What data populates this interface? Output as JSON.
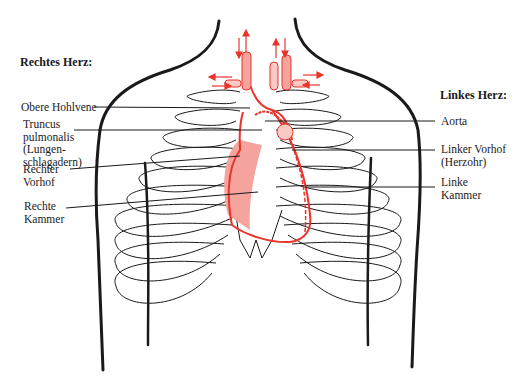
{
  "diagram": {
    "title_right_heart": "Rechtes Herz:",
    "title_left_heart": "Linkes Herz:",
    "colors": {
      "ink": "#1a1a1a",
      "heart_red": "#e8342c",
      "heart_fill": "#f4a49c",
      "background": "#ffffff"
    },
    "labels_right": [
      {
        "id": "obere-hohlvene",
        "lines": [
          "Obere Hohlvene"
        ]
      },
      {
        "id": "truncus-pulmonalis",
        "lines": [
          "Truncus",
          "pulmonalis",
          "(Lungen-",
          "schlagadern)"
        ]
      },
      {
        "id": "rechter-vorhof",
        "lines": [
          "Rechter",
          "Vorhof"
        ]
      },
      {
        "id": "rechte-kammer",
        "lines": [
          "Rechte",
          "Kammer"
        ]
      }
    ],
    "labels_left": [
      {
        "id": "aorta",
        "lines": [
          "Aorta"
        ]
      },
      {
        "id": "linker-vorhof",
        "lines": [
          "Linker Vorhof",
          "(Herzohr)"
        ]
      },
      {
        "id": "linke-kammer",
        "lines": [
          "Linke",
          "Kammer"
        ]
      }
    ],
    "flow_arrows": [
      "up",
      "down",
      "up",
      "down",
      "left",
      "right",
      "right",
      "left"
    ]
  }
}
